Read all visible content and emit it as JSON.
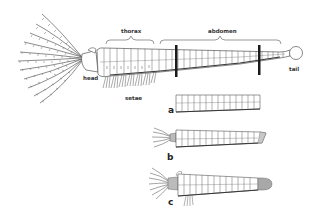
{
  "diagram": {
    "colors": {
      "ink": "#4a4a4a",
      "dark_band": "#1a1a1a",
      "shade": "#9a9a9a",
      "background": "#ffffff"
    },
    "labels": {
      "thorax": "thorax",
      "abdomen": "abdomen",
      "head": "head",
      "setae": "setae",
      "tail": "tail"
    },
    "stages": [
      {
        "id": "a",
        "label": "a"
      },
      {
        "id": "b",
        "label": "b"
      },
      {
        "id": "c",
        "label": "c"
      }
    ]
  }
}
